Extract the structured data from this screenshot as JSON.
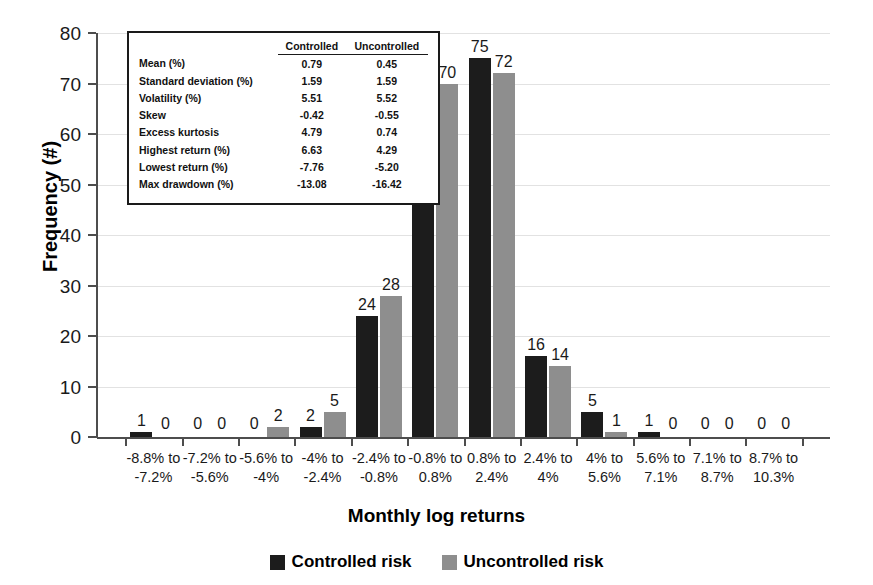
{
  "chart_data": {
    "type": "bar",
    "title": "",
    "xlabel": "Monthly log returns",
    "ylabel": "Frequency (#)",
    "ylim": [
      0,
      80
    ],
    "yticks": [
      0,
      10,
      20,
      30,
      40,
      50,
      60,
      70,
      80
    ],
    "grid": true,
    "legend_position": "bottom",
    "categories": [
      "-8.8% to -7.2%",
      "-7.2% to -5.6%",
      "-5.6% to -4%",
      "-4% to -2.4%",
      "-2.4% to -0.8%",
      "-0.8% to 0.8%",
      "0.8% to 2.4%",
      "2.4% to 4%",
      "4% to 5.6%",
      "5.6% to 7.1%",
      "7.1% to 8.7%",
      "8.7% to 10.3%"
    ],
    "category_lines": [
      [
        "-8.8% to",
        "-7.2%"
      ],
      [
        "-7.2% to",
        "-5.6%"
      ],
      [
        "-5.6% to",
        "-4%"
      ],
      [
        "-4% to",
        "-2.4%"
      ],
      [
        "-2.4% to",
        "-0.8%"
      ],
      [
        "-0.8% to",
        "0.8%"
      ],
      [
        "0.8% to",
        "2.4%"
      ],
      [
        "2.4% to",
        "4%"
      ],
      [
        "4% to",
        "5.6%"
      ],
      [
        "5.6% to",
        "7.1%"
      ],
      [
        "7.1% to",
        "8.7%"
      ],
      [
        "8.7% to",
        "10.3%"
      ]
    ],
    "series": [
      {
        "name": "Controlled risk",
        "color": "#1c1c1c",
        "values": [
          1,
          0,
          0,
          2,
          24,
          68,
          75,
          16,
          5,
          1,
          0,
          0
        ]
      },
      {
        "name": "Uncontrolled risk",
        "color": "#8e8e8e",
        "values": [
          0,
          0,
          2,
          5,
          28,
          70,
          72,
          14,
          1,
          0,
          0,
          0
        ]
      }
    ]
  },
  "stats_table": {
    "columns": [
      "",
      "Controlled",
      "Uncontrolled"
    ],
    "rows": [
      {
        "name": "Mean (%)",
        "controlled": "0.79",
        "uncontrolled": "0.45"
      },
      {
        "name": "Standard deviation (%)",
        "controlled": "1.59",
        "uncontrolled": "1.59"
      },
      {
        "name": "Volatility (%)",
        "controlled": "5.51",
        "uncontrolled": "5.52"
      },
      {
        "name": "Skew",
        "controlled": "-0.42",
        "uncontrolled": "-0.55"
      },
      {
        "name": "Excess kurtosis",
        "controlled": "4.79",
        "uncontrolled": "0.74"
      },
      {
        "name": "Highest return (%)",
        "controlled": "6.63",
        "uncontrolled": "4.29"
      },
      {
        "name": "Lowest return (%)",
        "controlled": "-7.76",
        "uncontrolled": "-5.20"
      },
      {
        "name": "Max drawdown (%)",
        "controlled": "-13.08",
        "uncontrolled": "-16.42"
      }
    ]
  }
}
